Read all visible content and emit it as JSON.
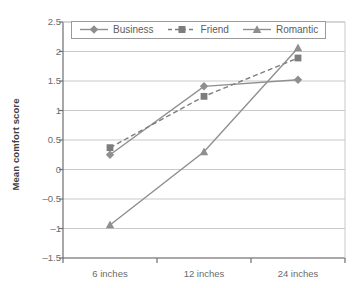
{
  "chart_data": {
    "type": "line",
    "title": "",
    "xlabel": "",
    "ylabel": "Mean comfort score",
    "categories": [
      "6 inches",
      "12 inches",
      "24 inches"
    ],
    "ylim": [
      -1.5,
      2.5
    ],
    "yticks": [
      2.5,
      2,
      1.5,
      1,
      0.5,
      0,
      -0.5,
      -1,
      -1.5
    ],
    "ytick_labels": [
      "2.5",
      "2",
      "1.5",
      "1",
      "0.5",
      "0",
      "-0.5",
      "-1",
      "-1.5"
    ],
    "grid": "horizontal",
    "legend_position": "top-center-inside",
    "series": [
      {
        "name": "Business",
        "values": [
          0.25,
          1.41,
          1.52
        ],
        "marker": "diamond",
        "line_style": "solid",
        "color": "#8f8f8f"
      },
      {
        "name": "Friend",
        "values": [
          0.37,
          1.24,
          1.89
        ],
        "marker": "square",
        "line_style": "dashed",
        "color": "#7d7d7d"
      },
      {
        "name": "Romantic",
        "values": [
          -0.94,
          0.3,
          2.06
        ],
        "marker": "triangle",
        "line_style": "solid",
        "color": "#8f8f8f"
      }
    ]
  },
  "legend": {
    "items": [
      {
        "label": "Business"
      },
      {
        "label": "Friend"
      },
      {
        "label": "Romantic"
      }
    ]
  },
  "axis": {
    "y_title": "Mean comfort score",
    "y_labels": [
      "2.5",
      "2",
      "1.5",
      "1",
      "0.5",
      "0",
      "-0.5",
      "-1",
      "-1.5"
    ],
    "x_labels": [
      "6 inches",
      "12 inches",
      "24 inches"
    ]
  },
  "colors": {
    "line": "#8f8f8f",
    "axis": "#6e6e6e",
    "grid": "#c9c9c9",
    "text": "#5d5d5d",
    "title_text": "#3d3d3d",
    "background": "#ffffff"
  }
}
